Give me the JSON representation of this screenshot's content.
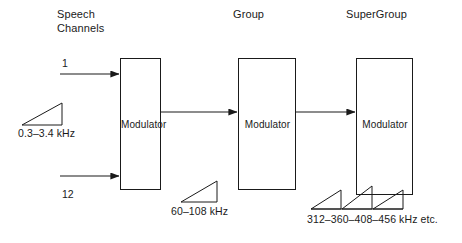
{
  "diagram": {
    "stroke_color": "#1a1a1a",
    "background_color": "#ffffff",
    "stages": [
      {
        "id": "speech-channels",
        "title": "Speech\nChannels",
        "modulator_label": "Modulator",
        "spectrum_label": "0.3–3.4 kHz"
      },
      {
        "id": "group",
        "title": "Group",
        "modulator_label": "Modulator",
        "spectrum_label": "60–108 kHz"
      },
      {
        "id": "supergroup",
        "title": "SuperGroup",
        "modulator_label": "Modulator",
        "spectrum_label": "312–360–408–456 kHz etc."
      }
    ],
    "inputs": {
      "first_channel": "1",
      "last_channel": "12"
    }
  }
}
